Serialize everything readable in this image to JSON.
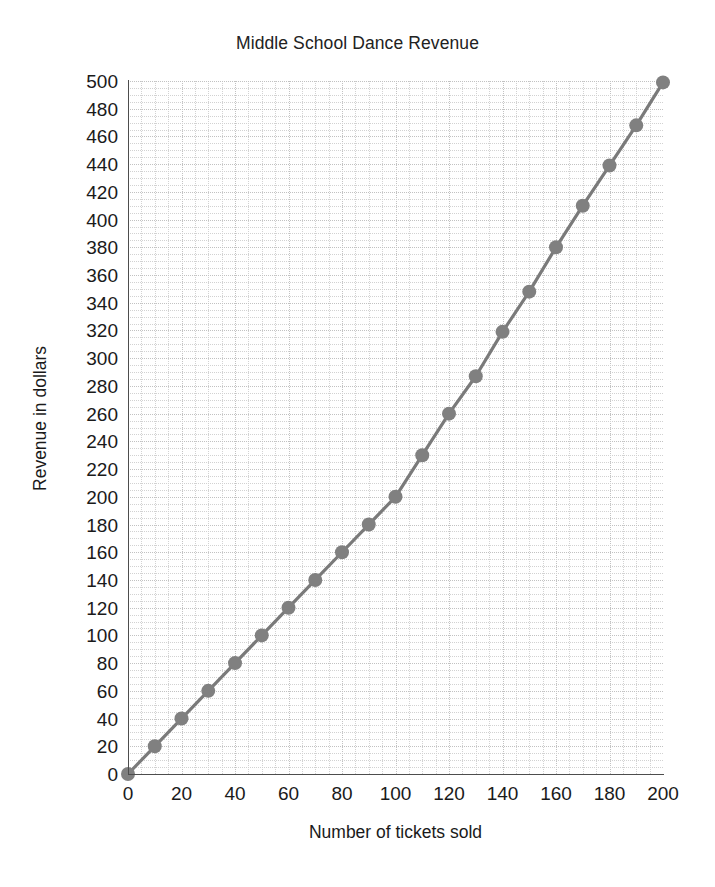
{
  "chart_data": {
    "type": "line",
    "title": "Middle School Dance Revenue",
    "xlabel": "Number of tickets sold",
    "ylabel": "Revenue in dollars",
    "xlim": [
      0,
      200
    ],
    "ylim": [
      0,
      500
    ],
    "xticks": [
      0,
      20,
      40,
      60,
      80,
      100,
      120,
      140,
      160,
      180,
      200
    ],
    "yticks": [
      0,
      20,
      40,
      60,
      80,
      100,
      120,
      140,
      160,
      180,
      200,
      220,
      240,
      260,
      280,
      300,
      320,
      340,
      360,
      380,
      400,
      420,
      440,
      460,
      480,
      500
    ],
    "grid": true,
    "grid_style": "dotted",
    "legend": null,
    "series": [
      {
        "name": "Revenue",
        "marker": "circle",
        "color": "#808080",
        "x": [
          0,
          10,
          20,
          30,
          40,
          50,
          60,
          70,
          80,
          90,
          100,
          110,
          120,
          130,
          140,
          150,
          160,
          170,
          180,
          190,
          200
        ],
        "y": [
          0,
          20,
          40,
          60,
          80,
          100,
          120,
          140,
          160,
          180,
          200,
          230,
          260,
          287,
          319,
          348,
          380,
          410,
          439,
          468,
          499
        ]
      }
    ]
  },
  "style": {
    "marker_color": "#808080",
    "line_color": "#7a7a7a",
    "grid_color": "#d2d2d2",
    "grid_major_color": "#c2c2c2",
    "axis_color": "#4d4d4d",
    "text_color": "#1a1a1a",
    "background": "#ffffff"
  }
}
